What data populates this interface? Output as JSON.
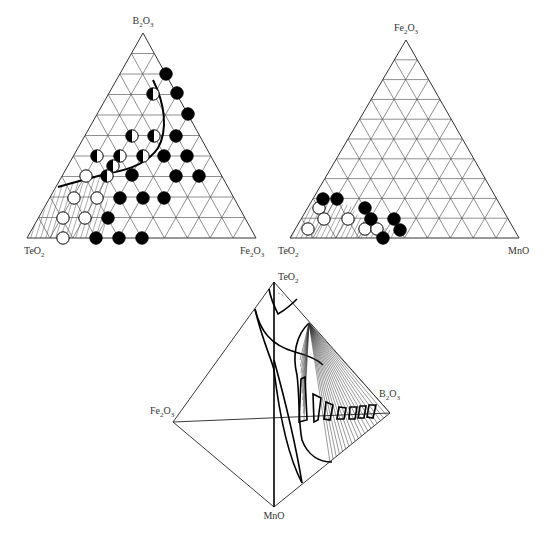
{
  "figure": {
    "panels": [
      {
        "id": "ternary-teo2-b2o3-fe2o3",
        "type": "ternary",
        "vertices": {
          "top": {
            "main": "B",
            "sub1": "2",
            "mid": "O",
            "sub2": "3",
            "text": "B2O3"
          },
          "left": {
            "main": "TeO",
            "sub1": "2",
            "mid": "",
            "sub2": "",
            "text": "TeO2"
          },
          "right": {
            "main": "Fe",
            "sub1": "2",
            "mid": "O",
            "sub2": "3",
            "text": "Fe2O3"
          }
        },
        "grid_divisions": 10,
        "legend_symbols": {
          "open": "glass",
          "half": "partially crystallized",
          "filled": "crystallized"
        },
        "points": {
          "filled": [
            [
              166,
              74
            ],
            [
              177,
              93
            ],
            [
              188,
              114
            ],
            [
              176,
              136
            ],
            [
              164,
              156
            ],
            [
              187,
              156
            ],
            [
              132,
              175
            ],
            [
              176,
              176
            ],
            [
              199,
              176
            ],
            [
              120,
              198
            ],
            [
              143,
              198
            ],
            [
              164,
              198
            ],
            [
              108,
              218
            ],
            [
              96,
              238
            ],
            [
              119,
              238
            ],
            [
              142,
              238
            ]
          ],
          "half": [
            [
              153,
              94
            ],
            [
              132,
              136
            ],
            [
              154,
              136
            ],
            [
              97,
              156
            ],
            [
              120,
              156
            ],
            [
              143,
              156
            ],
            [
              113,
              166
            ],
            [
              107,
              176
            ]
          ],
          "open": [
            [
              86,
              176
            ],
            [
              74,
              198
            ],
            [
              97,
              198
            ],
            [
              63,
              218
            ],
            [
              85,
              218
            ],
            [
              63,
              238
            ]
          ]
        }
      },
      {
        "id": "ternary-teo2-fe2o3-mno",
        "type": "ternary",
        "vertices": {
          "top": {
            "main": "Fe",
            "sub1": "2",
            "mid": "O",
            "sub2": "3",
            "text": "Fe2O3"
          },
          "left": {
            "main": "TeO",
            "sub1": "2",
            "mid": "",
            "sub2": "",
            "text": "TeO2"
          },
          "right": {
            "main": "MnO",
            "sub1": "",
            "mid": "",
            "sub2": "",
            "text": "MnO"
          }
        },
        "grid_divisions": 10,
        "points": {
          "filled": [
            [
              323,
              199
            ],
            [
              337,
              199
            ],
            [
              365,
              208
            ],
            [
              371,
              219
            ],
            [
              394,
              219
            ],
            [
              400,
              230
            ],
            [
              383,
              238
            ]
          ],
          "open": [
            [
              319,
              208
            ],
            [
              324,
              219
            ],
            [
              348,
              219
            ],
            [
              308,
              229
            ],
            [
              365,
              229
            ],
            [
              377,
              229
            ]
          ]
        }
      },
      {
        "id": "tetrahedron-teo2-fe2o3-mno-b2o3",
        "type": "tetrahedron",
        "vertices": {
          "top": {
            "main": "TeO",
            "sub1": "2",
            "mid": "",
            "sub2": "",
            "text": "TeO2"
          },
          "left": {
            "main": "Fe",
            "sub1": "2",
            "mid": "O",
            "sub2": "3",
            "text": "Fe2O3"
          },
          "bottom": {
            "main": "MnO",
            "sub1": "",
            "mid": "",
            "sub2": "",
            "text": "MnO"
          },
          "right": {
            "main": "B",
            "sub1": "2",
            "mid": "O",
            "sub2": "3",
            "text": "B2O3"
          }
        }
      }
    ]
  }
}
